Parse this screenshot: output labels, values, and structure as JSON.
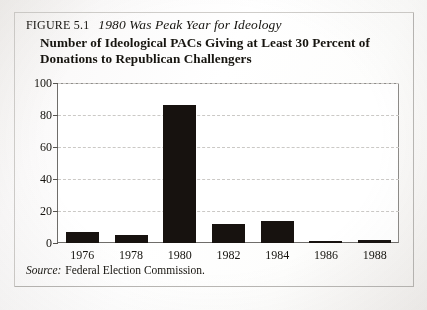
{
  "figure": {
    "number_label": "FIGURE 5.1",
    "title": "1980 Was Peak Year for Ideology",
    "subtitle_line1": "Number of Ideological PACs Giving at Least 30 Percent of",
    "subtitle_line2": "Donations to Republican Challengers",
    "source_label": "Source:",
    "source_text": "Federal Election Commission."
  },
  "chart_data": {
    "type": "bar",
    "title": "Number of Ideological PACs Giving at Least 30 Percent of Donations to Republican Challengers",
    "subtitle": "1980 Was Peak Year for Ideology",
    "categories": [
      "1976",
      "1978",
      "1980",
      "1982",
      "1984",
      "1986",
      "1988"
    ],
    "values": [
      7,
      5,
      86,
      12,
      14,
      1,
      2
    ],
    "xlabel": "",
    "ylabel": "",
    "ylim": [
      0,
      100
    ],
    "yticks": [
      0,
      20,
      40,
      60,
      80,
      100
    ],
    "ytick_labels": [
      "0",
      "20",
      "40",
      "60",
      "80",
      "100"
    ],
    "grid": true,
    "grid_style": "dashed-horizontal",
    "legend": "none",
    "bar_color": "#17120f",
    "source": "Federal Election Commission."
  }
}
